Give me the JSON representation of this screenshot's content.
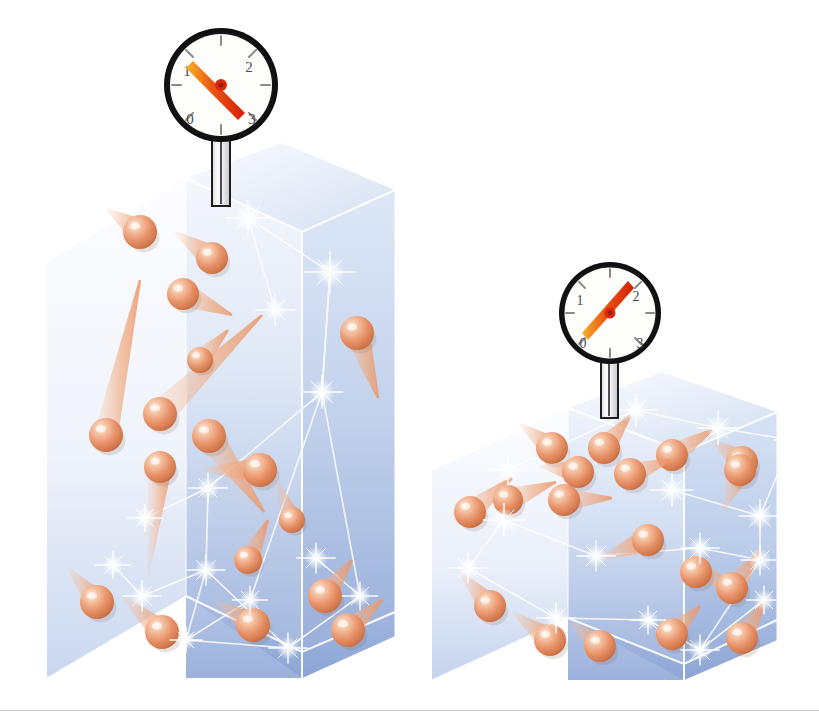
{
  "figure": {
    "title": "Gas pressure and volume illustration",
    "description": "Two transparent containers of gas with pressure gauges; the smaller volume shows a higher gauge reading.",
    "background_color": "#ffffff",
    "footer_rule_color": "#c9c9cf"
  },
  "palette": {
    "container_blue": "#9fb4de",
    "container_blue_light": "#ccd9ef",
    "container_pale": "#eef2fa",
    "container_edge": "#ffffff",
    "particle_core": "#e8enough",
    "particle_orange": "#e8956a",
    "particle_highlight": "#fde8dc",
    "particle_shadow": "#c4683f",
    "trail_orange": "#f0a97f",
    "sparkle_white": "#ffffff",
    "gauge_bezel": "#17171a",
    "gauge_face": "#fdfdfb",
    "gauge_needle_red": "#e02b0c",
    "gauge_needle_orange": "#f0a21e",
    "gauge_tick": "#8a8a8a",
    "gauge_numeral": "#4a4a4a",
    "stem_outline": "#1d1d20",
    "stem_fill": "#f2f2f4"
  },
  "gauges": [
    {
      "id": "gauge-left",
      "name": "pressure-gauge-left",
      "numerals": [
        "0",
        "1",
        "2",
        "3"
      ],
      "reading": "1",
      "reading_label": "low pressure",
      "needle_points_to": "1",
      "tick_count": 8,
      "center": {
        "x": 221,
        "y": 85
      },
      "radius": 57
    },
    {
      "id": "gauge-right",
      "name": "pressure-gauge-right",
      "numerals": [
        "0",
        "1",
        "2",
        "3"
      ],
      "reading": "2",
      "reading_label": "high pressure",
      "needle_points_to": "2",
      "tick_count": 8,
      "center": {
        "x": 610,
        "y": 313
      },
      "radius": 51
    }
  ],
  "containers": [
    {
      "id": "container-left",
      "name": "gas-container-tall",
      "shape": "rectangular-prism",
      "volume_label": "large volume",
      "pressure_label": "lower pressure",
      "particle_count": 17,
      "bounds": {
        "x": 47,
        "y": 178,
        "width": 348,
        "height": 500
      }
    },
    {
      "id": "container-right",
      "name": "gas-container-short",
      "shape": "cube",
      "volume_label": "small volume",
      "pressure_label": "higher pressure",
      "particle_count": 18,
      "bounds": {
        "x": 432,
        "y": 408,
        "width": 345,
        "height": 272
      }
    }
  ],
  "chart_data": {
    "type": "diagram",
    "panels": [
      {
        "panel": "left",
        "volume": "large",
        "gauge_reading": 1,
        "particles": 17
      },
      {
        "panel": "right",
        "volume": "small",
        "gauge_reading": 2,
        "particles": 18
      }
    ],
    "gauge_scale": {
      "min": 0,
      "max": 3,
      "ticks": [
        0,
        1,
        2,
        3
      ]
    }
  },
  "particles_left": [
    {
      "x": 140,
      "y": 232,
      "r": 17,
      "tx": 107,
      "ty": 209,
      "tw": 13
    },
    {
      "x": 212,
      "y": 258,
      "r": 16,
      "tx": 175,
      "ty": 232,
      "tw": 13
    },
    {
      "x": 183,
      "y": 294,
      "r": 16,
      "tx": 232,
      "ty": 315,
      "tw": 13
    },
    {
      "x": 106,
      "y": 435,
      "r": 17,
      "tx": 140,
      "ty": 280,
      "tw": 12
    },
    {
      "x": 160,
      "y": 414,
      "r": 17,
      "tx": 262,
      "ty": 315,
      "tw": 14
    },
    {
      "x": 357,
      "y": 333,
      "r": 17,
      "tx": 378,
      "ty": 398,
      "tw": 13
    },
    {
      "x": 209,
      "y": 436,
      "r": 17,
      "tx": 264,
      "ty": 512,
      "tw": 14
    },
    {
      "x": 160,
      "y": 467,
      "r": 16,
      "tx": 148,
      "ty": 575,
      "tw": 12
    },
    {
      "x": 260,
      "y": 470,
      "r": 17,
      "tx": 200,
      "ty": 470,
      "tw": 13
    },
    {
      "x": 97,
      "y": 602,
      "r": 17,
      "tx": 68,
      "ty": 568,
      "tw": 12
    },
    {
      "x": 162,
      "y": 632,
      "r": 17,
      "tx": 122,
      "ty": 596,
      "tw": 12
    },
    {
      "x": 253,
      "y": 625,
      "r": 17,
      "tx": 214,
      "ty": 600,
      "tw": 13
    },
    {
      "x": 325,
      "y": 596,
      "r": 17,
      "tx": 352,
      "ty": 560,
      "tw": 12
    },
    {
      "x": 348,
      "y": 630,
      "r": 17,
      "tx": 382,
      "ty": 600,
      "tw": 12
    },
    {
      "x": 248,
      "y": 560,
      "r": 14,
      "tx": 268,
      "ty": 520,
      "tw": 11
    },
    {
      "x": 292,
      "y": 520,
      "r": 13,
      "tx": 276,
      "ty": 480,
      "tw": 10
    },
    {
      "x": 200,
      "y": 360,
      "r": 13,
      "tx": 228,
      "ty": 330,
      "tw": 10
    }
  ],
  "sparkles_left": [
    {
      "x": 248,
      "y": 218,
      "s": 14
    },
    {
      "x": 330,
      "y": 272,
      "s": 16
    },
    {
      "x": 275,
      "y": 310,
      "s": 12
    },
    {
      "x": 322,
      "y": 392,
      "s": 13
    },
    {
      "x": 145,
      "y": 518,
      "s": 11
    },
    {
      "x": 208,
      "y": 488,
      "s": 12
    },
    {
      "x": 206,
      "y": 570,
      "s": 12
    },
    {
      "x": 113,
      "y": 565,
      "s": 11
    },
    {
      "x": 142,
      "y": 596,
      "s": 12
    },
    {
      "x": 316,
      "y": 558,
      "s": 12
    },
    {
      "x": 360,
      "y": 596,
      "s": 11
    },
    {
      "x": 288,
      "y": 648,
      "s": 12
    },
    {
      "x": 186,
      "y": 640,
      "s": 10
    },
    {
      "x": 250,
      "y": 600,
      "s": 11
    }
  ],
  "particles_right": [
    {
      "x": 552,
      "y": 448,
      "r": 16,
      "tx": 520,
      "ty": 424,
      "tw": 12
    },
    {
      "x": 604,
      "y": 448,
      "r": 16,
      "tx": 630,
      "ty": 416,
      "tw": 12
    },
    {
      "x": 672,
      "y": 455,
      "r": 16,
      "tx": 712,
      "ty": 430,
      "tw": 12
    },
    {
      "x": 742,
      "y": 462,
      "r": 16,
      "tx": 712,
      "ty": 440,
      "tw": 12
    },
    {
      "x": 578,
      "y": 472,
      "r": 16,
      "tx": 540,
      "ty": 466,
      "tw": 12
    },
    {
      "x": 630,
      "y": 474,
      "r": 16,
      "tx": 670,
      "ty": 460,
      "tw": 12
    },
    {
      "x": 470,
      "y": 512,
      "r": 16,
      "tx": 512,
      "ty": 478,
      "tw": 12
    },
    {
      "x": 508,
      "y": 500,
      "r": 15,
      "tx": 556,
      "ty": 482,
      "tw": 12
    },
    {
      "x": 564,
      "y": 500,
      "r": 16,
      "tx": 612,
      "ty": 498,
      "tw": 12
    },
    {
      "x": 740,
      "y": 470,
      "r": 16,
      "tx": 722,
      "ty": 512,
      "tw": 12
    },
    {
      "x": 648,
      "y": 540,
      "r": 16,
      "tx": 596,
      "ty": 560,
      "tw": 12
    },
    {
      "x": 696,
      "y": 572,
      "r": 16,
      "tx": 740,
      "ty": 588,
      "tw": 12
    },
    {
      "x": 732,
      "y": 588,
      "r": 16,
      "tx": 760,
      "ty": 552,
      "tw": 12
    },
    {
      "x": 490,
      "y": 606,
      "r": 16,
      "tx": 460,
      "ty": 572,
      "tw": 12
    },
    {
      "x": 550,
      "y": 640,
      "r": 16,
      "tx": 512,
      "ty": 612,
      "tw": 12
    },
    {
      "x": 600,
      "y": 646,
      "r": 16,
      "tx": 570,
      "ty": 622,
      "tw": 12
    },
    {
      "x": 672,
      "y": 634,
      "r": 16,
      "tx": 700,
      "ty": 606,
      "tw": 12
    },
    {
      "x": 742,
      "y": 638,
      "r": 16,
      "tx": 766,
      "ty": 600,
      "tw": 12
    }
  ],
  "sparkles_right": [
    {
      "x": 636,
      "y": 410,
      "s": 13
    },
    {
      "x": 718,
      "y": 428,
      "s": 13
    },
    {
      "x": 792,
      "y": 440,
      "s": 11
    },
    {
      "x": 508,
      "y": 470,
      "s": 12
    },
    {
      "x": 672,
      "y": 490,
      "s": 13
    },
    {
      "x": 760,
      "y": 516,
      "s": 13
    },
    {
      "x": 504,
      "y": 520,
      "s": 13
    },
    {
      "x": 468,
      "y": 568,
      "s": 12
    },
    {
      "x": 596,
      "y": 556,
      "s": 12
    },
    {
      "x": 700,
      "y": 548,
      "s": 12
    },
    {
      "x": 760,
      "y": 560,
      "s": 12
    },
    {
      "x": 556,
      "y": 618,
      "s": 12
    },
    {
      "x": 648,
      "y": 620,
      "s": 11
    },
    {
      "x": 700,
      "y": 650,
      "s": 12
    },
    {
      "x": 764,
      "y": 600,
      "s": 11
    }
  ]
}
